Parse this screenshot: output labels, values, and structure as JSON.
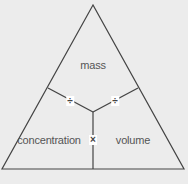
{
  "diagram": {
    "type": "formula-triangle",
    "labels": {
      "top": "mass",
      "bottom_left": "concentration",
      "bottom_right": "volume"
    },
    "operators": {
      "left_divide": "÷",
      "right_divide": "÷",
      "multiply": "×"
    },
    "colors": {
      "background": "#ececec",
      "line": "#444444",
      "text": "#555555",
      "operator_bg": "#ffffff"
    }
  }
}
